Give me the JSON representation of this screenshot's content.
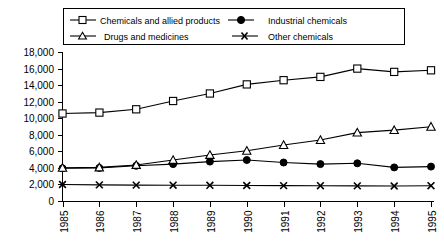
{
  "chart_data": {
    "type": "line",
    "title": "",
    "subtitle": "",
    "xlabel": "",
    "ylabel": "",
    "grid": false,
    "legend_position": "top",
    "categories": [
      "1985",
      "1986",
      "1987",
      "1988",
      "1989",
      "1990",
      "1991",
      "1992",
      "1993",
      "1994",
      "1995"
    ],
    "x": [
      1985,
      1986,
      1987,
      1988,
      1989,
      1990,
      1991,
      1992,
      1993,
      1994,
      1995
    ],
    "xlim": [
      1985,
      1995
    ],
    "ylim": [
      0,
      18000
    ],
    "ytick_labels": [
      "18,000",
      "16,000",
      "14,000",
      "12,000",
      "10,000",
      "8,000",
      "6,000",
      "4,000",
      "2,000",
      "0"
    ],
    "yticks": [
      18000,
      16000,
      14000,
      12000,
      10000,
      8000,
      6000,
      4000,
      2000,
      0
    ],
    "series": [
      {
        "name": "Chemicals and allied products",
        "marker": "open-square",
        "values": [
          10600,
          10700,
          11100,
          12100,
          13000,
          14100,
          14600,
          15000,
          16000,
          15600,
          15800
        ]
      },
      {
        "name": "Industrial chemicals",
        "marker": "filled-circle",
        "values": [
          4000,
          4050,
          4300,
          4500,
          4800,
          5000,
          4700,
          4500,
          4600,
          4100,
          4200
        ]
      },
      {
        "name": "Drugs and medicines",
        "marker": "open-triangle",
        "values": [
          4050,
          4100,
          4400,
          5000,
          5600,
          6100,
          6800,
          7400,
          8300,
          8600,
          9000
        ]
      },
      {
        "name": "Other chemicals",
        "marker": "cross",
        "values": [
          2050,
          2000,
          1980,
          1960,
          1950,
          1930,
          1920,
          1900,
          1880,
          1870,
          1900
        ]
      }
    ]
  },
  "legend": {
    "entries": [
      {
        "label": "Chemicals and allied products",
        "marker": "open-square"
      },
      {
        "label": "Industrial chemicals",
        "marker": "filled-circle"
      },
      {
        "label": "Drugs and medicines",
        "marker": "open-triangle"
      },
      {
        "label": "Other chemicals",
        "marker": "cross"
      }
    ]
  },
  "colors": {
    "foreground": "#000000",
    "background": "#ffffff"
  }
}
